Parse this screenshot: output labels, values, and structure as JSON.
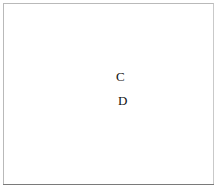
{
  "figure": {
    "kind": "sewing-stitch-diagram",
    "frame": {
      "border_color": "#b9b9b9",
      "bottom_rule_color": "#7a7a7a",
      "background": "#ffffff",
      "width": 217,
      "height": 188
    },
    "labels": [
      {
        "id": "C",
        "text": "C",
        "x": 116,
        "y": 70
      },
      {
        "id": "D",
        "text": "D",
        "x": 118,
        "y": 94
      }
    ],
    "colors": {
      "thread_fill": "#c8c8c8",
      "thread_fill_light": "#e4e4e4",
      "thread_outline": "#4a4a4a",
      "needle_fill": "#f2f2f2",
      "needle_outline": "#2f2f2f",
      "needle_shadow": "#9a9a9a",
      "dashed_guide": "#8d8d8d",
      "label_text": "#111111"
    },
    "elements": {
      "needle_name": "sewing-needle",
      "needle_eye_name": "needle-eye",
      "needle_point_name": "needle-point",
      "thread_loop_name": "thread-loop",
      "thread_tail_name": "thread-tail",
      "knot_name": "thread-knot-crossing",
      "guide_name": "dashed-guide-line"
    }
  }
}
